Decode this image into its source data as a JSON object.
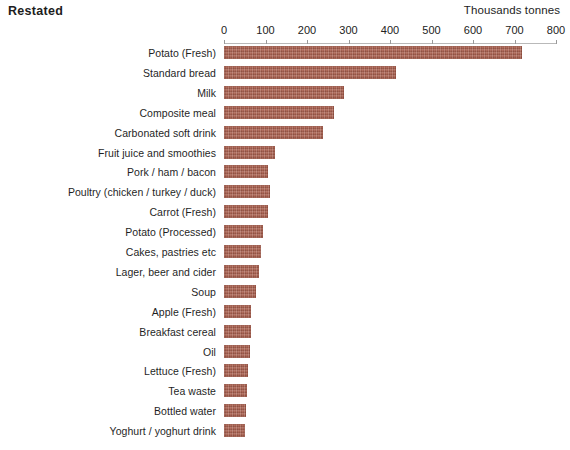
{
  "chart": {
    "title": "Restated",
    "axis_title": "Thousands tonnes"
  },
  "chart_data": {
    "type": "bar",
    "orientation": "horizontal",
    "title": "Restated",
    "xlabel": "Thousands tonnes",
    "ylabel": "",
    "xlim": [
      0,
      800
    ],
    "xticks": [
      0,
      100,
      200,
      300,
      400,
      500,
      600,
      700,
      800
    ],
    "grid": false,
    "legend": "none",
    "bar_color": "#a9604f",
    "categories": [
      "Potato (Fresh)",
      "Standard bread",
      "Milk",
      "Composite meal",
      "Carbonated soft drink",
      "Fruit juice and smoothies",
      "Pork / ham / bacon",
      "Poultry (chicken / turkey / duck)",
      "Carrot (Fresh)",
      "Potato (Processed)",
      "Cakes, pastries  etc",
      "Lager, beer and cider",
      "Soup",
      "Apple (Fresh)",
      "Breakfast cereal",
      "Oil",
      "Lettuce (Fresh)",
      "Tea waste",
      "Bottled water",
      "Yoghurt / yoghurt drink"
    ],
    "values": [
      718,
      415,
      290,
      265,
      238,
      123,
      106,
      110,
      106,
      95,
      88,
      84,
      76,
      66,
      64,
      62,
      58,
      56,
      54,
      50
    ]
  }
}
